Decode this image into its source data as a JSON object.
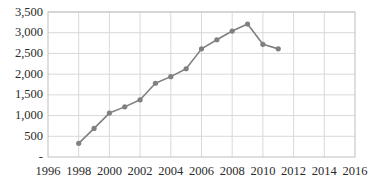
{
  "chart_data": {
    "type": "line",
    "title": "",
    "subtitle": "",
    "xlabel": "",
    "ylabel": "",
    "x": [
      1998,
      1999,
      2000,
      2001,
      2002,
      2003,
      2004,
      2005,
      2006,
      2007,
      2008,
      2009,
      2010,
      2011,
      2012,
      2013,
      2014
    ],
    "values": [
      330,
      690,
      1060,
      1210,
      1380,
      1780,
      1940,
      2130,
      2610,
      2830,
      3040,
      3210,
      2720,
      2610,
      null,
      null,
      null
    ],
    "series": [
      {
        "name": "series-1",
        "points": [
          {
            "x": 1998,
            "y": 330
          },
          {
            "x": 1999,
            "y": 690
          },
          {
            "x": 2000,
            "y": 1060
          },
          {
            "x": 2001,
            "y": 1210
          },
          {
            "x": 2002,
            "y": 1380
          },
          {
            "x": 2003,
            "y": 1780
          },
          {
            "x": 2004,
            "y": 1940
          },
          {
            "x": 2005,
            "y": 2130
          },
          {
            "x": 2006,
            "y": 2610
          },
          {
            "x": 2007,
            "y": 2830
          },
          {
            "x": 2008,
            "y": 3040
          },
          {
            "x": 2009,
            "y": 3210
          },
          {
            "x": 2010,
            "y": 2720
          },
          {
            "x": 2011,
            "y": 2610
          }
        ],
        "color": "#808080"
      }
    ],
    "xlim": [
      1996,
      2016
    ],
    "ylim": [
      0,
      3500
    ],
    "xticks": [
      1996,
      1998,
      2000,
      2002,
      2004,
      2006,
      2008,
      2010,
      2012,
      2014,
      2016
    ],
    "xtick_labels": [
      "1996",
      "1998",
      "2000",
      "2002",
      "2004",
      "2006",
      "2008",
      "2010",
      "2012",
      "2014",
      "2016"
    ],
    "yticks": [
      0,
      500,
      1000,
      1500,
      2000,
      2500,
      3000,
      3500
    ],
    "ytick_labels": [
      "-",
      "500",
      "1,000",
      "1,500",
      "2,000",
      "2,500",
      "3,000",
      "3,500"
    ],
    "grid": true,
    "grid_axis": "both",
    "grid_color": "#d9d9d9",
    "border_color": "#bfbfbf",
    "legend": false,
    "legend_position": "none",
    "marker": "circle",
    "marker_color": "#808080",
    "line_color": "#808080",
    "background": "#ffffff"
  },
  "axes": {
    "y_tick_labels": [
      "3,500",
      "3,000",
      "2,500",
      "2,000",
      "1,500",
      "1,000",
      "500",
      "-"
    ],
    "x_tick_labels": [
      "1996",
      "1998",
      "2000",
      "2002",
      "2004",
      "2006",
      "2008",
      "2010",
      "2012",
      "2014",
      "2016"
    ]
  }
}
